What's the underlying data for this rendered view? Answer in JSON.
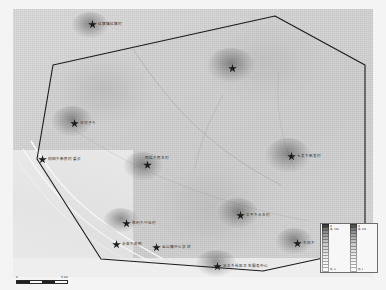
{
  "figure": {
    "kind": "thematic-raster-map"
  },
  "colors": {
    "raster_base": "#d4d4d4",
    "outside_area": "#ececec",
    "boundary_line": "#1a1a1a",
    "marker_fill": "#1d1d1d",
    "label_text": "#141414",
    "legend_background": "#f7f7f7",
    "legend_border": "#6d6d6d",
    "page_background": "#f2f2f2"
  },
  "markers": [
    {
      "id": "m01",
      "label": "红旗镇红旗村",
      "x": 88,
      "y": 20,
      "label_pos": "right"
    },
    {
      "id": "m02",
      "label": "",
      "x": 228,
      "y": 64,
      "label_pos": "right"
    },
    {
      "id": "m03",
      "label": "双河子乡",
      "x": 70,
      "y": 119,
      "label_pos": "right"
    },
    {
      "id": "m04",
      "label": "向阳乡新民村委会",
      "x": 38,
      "y": 155,
      "label_pos": "right"
    },
    {
      "id": "m05",
      "label": "团结乡民主村",
      "x": 143,
      "y": 163,
      "label_pos": "above"
    },
    {
      "id": "m06",
      "label": "长发乡新发村",
      "x": 287,
      "y": 152,
      "label_pos": "right"
    },
    {
      "id": "m07",
      "label": "胜利乡兴业村",
      "x": 122,
      "y": 219,
      "label_pos": "right"
    },
    {
      "id": "m08",
      "label": "太平乡永丰村",
      "x": 236,
      "y": 211,
      "label_pos": "right"
    },
    {
      "id": "m09",
      "label": "永安乡政府",
      "x": 112,
      "y": 240,
      "label_pos": "right"
    },
    {
      "id": "m10",
      "label": "金山镇中心学校",
      "x": 152,
      "y": 243,
      "label_pos": "right"
    },
    {
      "id": "m11",
      "label": "庆丰乡社区卫生服务中心",
      "x": 213,
      "y": 262,
      "label_pos": "right"
    },
    {
      "id": "m12",
      "label": "东风乡",
      "x": 293,
      "y": 239,
      "label_pos": "right"
    }
  ],
  "legend": {
    "title": "",
    "column_1": [
      {
        "swatch": "#3f3f3f",
        "text": "值"
      },
      {
        "swatch": "#6e6e6e",
        "text": "高 : 255"
      },
      {
        "swatch": "#8a8a8a",
        "text": ""
      },
      {
        "swatch": "#9c9c9c",
        "text": ""
      },
      {
        "swatch": "#aeaeae",
        "text": ""
      },
      {
        "swatch": "#bcbcbc",
        "text": ""
      },
      {
        "swatch": "#c8c8c8",
        "text": ""
      },
      {
        "swatch": "#d3d3d3",
        "text": ""
      },
      {
        "swatch": "#dcdcdc",
        "text": ""
      },
      {
        "swatch": "#e4e4e4",
        "text": ""
      },
      {
        "swatch": "#ebebeb",
        "text": ""
      },
      {
        "swatch": "#f1f1f1",
        "text": ""
      },
      {
        "swatch": "#f6f6f6",
        "text": ""
      },
      {
        "swatch": "#fafafa",
        "text": ""
      },
      {
        "swatch": "#fdfdfd",
        "text": "低 : 0"
      }
    ],
    "column_2": [
      {
        "swatch": "#555555",
        "text": "值"
      },
      {
        "swatch": "#777777",
        "text": "高 : 255"
      },
      {
        "swatch": "#8f8f8f",
        "text": ""
      },
      {
        "swatch": "#a1a1a1",
        "text": ""
      },
      {
        "swatch": "#b2b2b2",
        "text": ""
      },
      {
        "swatch": "#bfbfbf",
        "text": ""
      },
      {
        "swatch": "#cacaca",
        "text": ""
      },
      {
        "swatch": "#d5d5d5",
        "text": ""
      },
      {
        "swatch": "#dedede",
        "text": ""
      },
      {
        "swatch": "#e6e6e6",
        "text": ""
      },
      {
        "swatch": "#ededed",
        "text": ""
      },
      {
        "swatch": "#f2f2f2",
        "text": ""
      },
      {
        "swatch": "#f7f7f7",
        "text": ""
      },
      {
        "swatch": "#fbfbfb",
        "text": ""
      },
      {
        "swatch": "#ffffff",
        "text": "低 : 0"
      }
    ]
  },
  "scalebar": {
    "left_label": "0",
    "right_label": "5 km",
    "segments": [
      "dark",
      "light",
      "dark",
      "light"
    ]
  }
}
